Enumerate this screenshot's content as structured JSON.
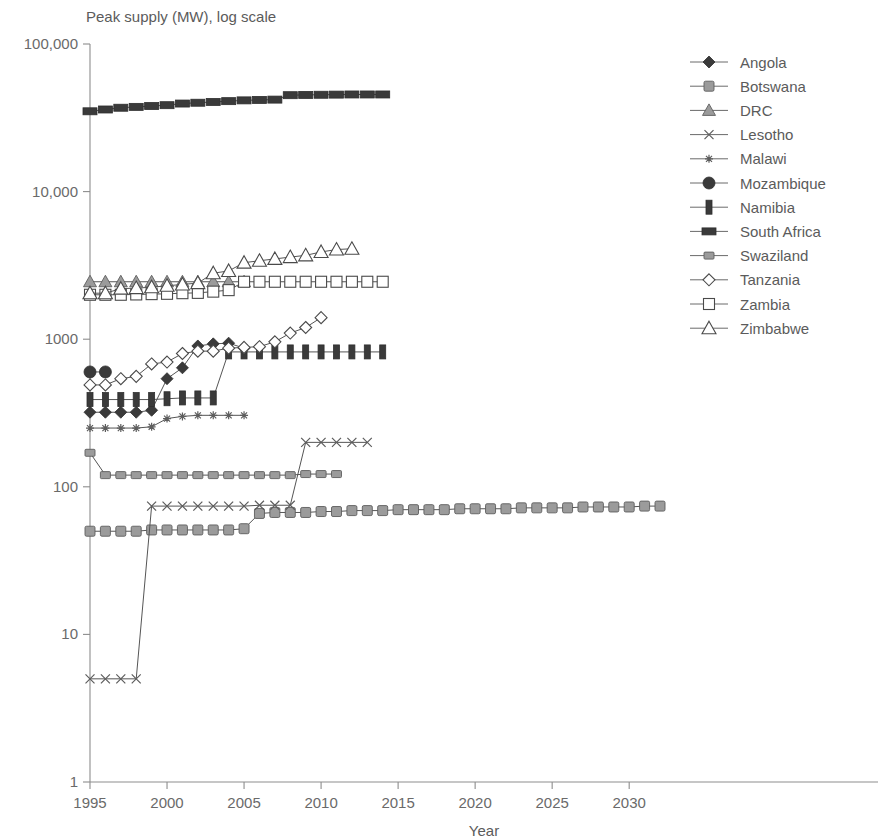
{
  "chart_data": {
    "type": "line",
    "title": "Peak supply (MW), log scale",
    "xlabel": "Year",
    "ylabel": "Peak supply (MW), log scale",
    "yscale": "log",
    "xlim": [
      1995,
      2032
    ],
    "ylim": [
      1,
      100000
    ],
    "grid": false,
    "legend_position": "right",
    "yticks": [
      1,
      10,
      100,
      1000,
      10000,
      100000
    ],
    "ytick_labels": [
      "1",
      "10",
      "100",
      "1000",
      "10,000",
      "100,000"
    ],
    "xticks": [
      1995,
      2000,
      2005,
      2010,
      2015,
      2020,
      2025,
      2030
    ],
    "xtick_labels": [
      "1995",
      "2000",
      "2005",
      "2010",
      "2015",
      "2020",
      "2025",
      "2030"
    ],
    "series": [
      {
        "name": "Angola",
        "marker": "filled-diamond",
        "x": [
          1995,
          1996,
          1997,
          1998,
          1999,
          2000,
          2001,
          2002,
          2003,
          2004,
          2005
        ],
        "values": [
          320,
          320,
          320,
          320,
          330,
          540,
          640,
          900,
          930,
          940,
          870
        ]
      },
      {
        "name": "Botswana",
        "marker": "grey-square",
        "x": [
          1995,
          1996,
          1997,
          1998,
          1999,
          2000,
          2001,
          2002,
          2003,
          2004,
          2005,
          2006,
          2007,
          2008,
          2009,
          2010,
          2011,
          2012,
          2013,
          2014,
          2015,
          2016,
          2017,
          2018,
          2019,
          2020,
          2021,
          2022,
          2023,
          2024,
          2025,
          2026,
          2027,
          2028,
          2029,
          2030,
          2031,
          2032
        ],
        "values": [
          50,
          50,
          50,
          50,
          51,
          51,
          51,
          51,
          51,
          51,
          52,
          66,
          67,
          67,
          67,
          68,
          68,
          69,
          69,
          69,
          70,
          70,
          70,
          70,
          71,
          71,
          71,
          71,
          72,
          72,
          72,
          72,
          73,
          73,
          73,
          73,
          74,
          74
        ]
      },
      {
        "name": "DRC",
        "marker": "grey-triangle",
        "x": [
          1995,
          1996,
          1997,
          1998,
          1999,
          2000,
          2001,
          2002,
          2003,
          2004,
          2005
        ],
        "values": [
          2450,
          2450,
          2450,
          2450,
          2450,
          2450,
          2450,
          2450,
          2450,
          2450,
          2450
        ]
      },
      {
        "name": "Lesotho",
        "marker": "cross",
        "x": [
          1995,
          1996,
          1997,
          1998,
          1999,
          2000,
          2001,
          2002,
          2003,
          2004,
          2005,
          2006,
          2007,
          2008,
          2009,
          2010,
          2011,
          2012,
          2013
        ],
        "values": [
          5,
          5,
          5,
          5,
          74,
          74,
          74,
          74,
          74,
          74,
          74,
          75,
          75,
          75,
          200,
          200,
          200,
          200,
          200
        ]
      },
      {
        "name": "Malawi",
        "marker": "small-star",
        "x": [
          1995,
          1996,
          1997,
          1998,
          1999,
          2000,
          2001,
          2002,
          2003,
          2004,
          2005
        ],
        "values": [
          250,
          250,
          250,
          250,
          255,
          290,
          300,
          305,
          305,
          305,
          305
        ]
      },
      {
        "name": "Mozambique",
        "marker": "filled-circle",
        "x": [
          1995,
          1996
        ],
        "values": [
          600,
          600
        ]
      },
      {
        "name": "Namibia",
        "marker": "i-bar",
        "x": [
          1995,
          1996,
          1997,
          1998,
          1999,
          2000,
          2001,
          2002,
          2003,
          2004,
          2005,
          2006,
          2007,
          2008,
          2009,
          2010,
          2011,
          2012,
          2013,
          2014
        ],
        "values": [
          390,
          390,
          390,
          390,
          390,
          395,
          400,
          400,
          400,
          820,
          820,
          820,
          820,
          820,
          820,
          820,
          820,
          820,
          820,
          820
        ]
      },
      {
        "name": "South Africa",
        "marker": "filled-square",
        "x": [
          1995,
          1996,
          1997,
          1998,
          1999,
          2000,
          2001,
          2002,
          2003,
          2004,
          2005,
          2006,
          2007,
          2008,
          2009,
          2010,
          2011,
          2012,
          2013,
          2014
        ],
        "values": [
          35000,
          36000,
          37000,
          37500,
          38000,
          38500,
          39500,
          40000,
          40500,
          41000,
          41500,
          41800,
          42000,
          45000,
          45200,
          45300,
          45400,
          45500,
          45500,
          45500
        ]
      },
      {
        "name": "Swaziland",
        "marker": "small-grey-square",
        "x": [
          1995,
          1996,
          1997,
          1998,
          1999,
          2000,
          2001,
          2002,
          2003,
          2004,
          2005,
          2006,
          2007,
          2008,
          2009,
          2010,
          2011
        ],
        "values": [
          170,
          120,
          120,
          120,
          120,
          120,
          120,
          120,
          120,
          120,
          120,
          120,
          120,
          120,
          122,
          122,
          122
        ]
      },
      {
        "name": "Tanzania",
        "marker": "open-diamond",
        "x": [
          1995,
          1996,
          1997,
          1998,
          1999,
          2000,
          2001,
          2002,
          2003,
          2004,
          2005,
          2006,
          2007,
          2008,
          2009,
          2010
        ],
        "values": [
          490,
          490,
          540,
          560,
          680,
          700,
          800,
          830,
          830,
          870,
          880,
          890,
          960,
          1100,
          1200,
          1400
        ]
      },
      {
        "name": "Zambia",
        "marker": "open-square",
        "x": [
          1995,
          1996,
          1997,
          1998,
          1999,
          2000,
          2001,
          2002,
          2003,
          2004,
          2005,
          2006,
          2007,
          2008,
          2009,
          2010,
          2011,
          2012,
          2013,
          2014
        ],
        "values": [
          2000,
          2000,
          2000,
          2010,
          2020,
          2030,
          2050,
          2060,
          2100,
          2150,
          2450,
          2450,
          2450,
          2450,
          2450,
          2450,
          2450,
          2450,
          2450,
          2450
        ]
      },
      {
        "name": "Zimbabwe",
        "marker": "open-triangle",
        "x": [
          1995,
          1996,
          1997,
          1998,
          1999,
          2000,
          2001,
          2002,
          2003,
          2004,
          2005,
          2006,
          2007,
          2008,
          2009,
          2010,
          2011,
          2012
        ],
        "values": [
          2050,
          2050,
          2200,
          2220,
          2250,
          2300,
          2350,
          2400,
          2800,
          2900,
          3300,
          3400,
          3500,
          3600,
          3700,
          3900,
          4050,
          4100
        ]
      }
    ]
  },
  "legend": {
    "items": [
      {
        "label": "Angola"
      },
      {
        "label": "Botswana"
      },
      {
        "label": "DRC"
      },
      {
        "label": "Lesotho"
      },
      {
        "label": "Malawi"
      },
      {
        "label": "Mozambique"
      },
      {
        "label": "Namibia"
      },
      {
        "label": "South Africa"
      },
      {
        "label": "Swaziland"
      },
      {
        "label": "Tanzania"
      },
      {
        "label": "Zambia"
      },
      {
        "label": "Zimbabwe"
      }
    ]
  },
  "colors": {
    "axis": "#8d8d8d",
    "text": "#5b5b5b",
    "line": "#555555",
    "marker_fill": "#3a3a3a",
    "marker_grey": "#9b9b9b",
    "background": "#ffffff"
  }
}
